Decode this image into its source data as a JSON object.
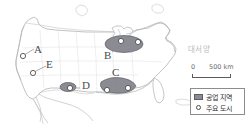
{
  "map": {
    "title_visible": false,
    "ocean_label": "대서양",
    "region_labels": [
      {
        "id": "A",
        "text": "A",
        "x": 34,
        "y": 44
      },
      {
        "id": "B",
        "text": "B",
        "x": 104,
        "y": 50
      },
      {
        "id": "C",
        "text": "C",
        "x": 112,
        "y": 74
      },
      {
        "id": "D",
        "text": "D",
        "x": 82,
        "y": 85
      },
      {
        "id": "E",
        "text": "E",
        "x": 46,
        "y": 61
      }
    ],
    "industrial_regions": [
      {
        "label": "B",
        "name": "northeast-industrial-belt"
      },
      {
        "label": "C",
        "name": "gulf-coast-industrial-belt"
      },
      {
        "label": "D",
        "name": "southwest-industrial-area"
      }
    ],
    "major_cities_count": 7,
    "colors": {
      "industrial_fill": "#8b8b93",
      "industrial_stroke": "#5d5d64",
      "coastline": "#b0b0b4",
      "border": "#c2c2c6",
      "city_marker": "#ffffff",
      "city_marker_stroke": "#4e4e4e",
      "ocean_text": "#b9b9bd",
      "label_text": "#4a4a4a"
    }
  },
  "scale": {
    "zero": "0",
    "max": "500 km",
    "unit": "km"
  },
  "legend": {
    "items": [
      {
        "symbol": "filled-rectangle",
        "label": "공업 지역"
      },
      {
        "symbol": "open-circle",
        "label": "주요 도시"
      }
    ]
  }
}
